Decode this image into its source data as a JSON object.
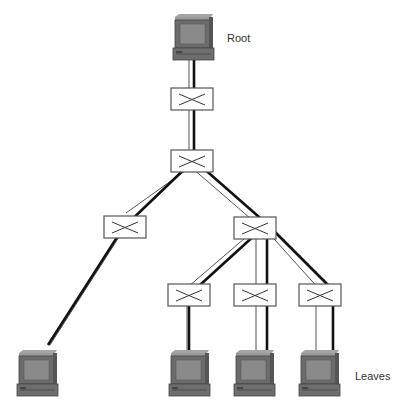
{
  "labels": {
    "root": "Root",
    "leaves": "Leaves"
  },
  "colors": {
    "computer_body": "#6b6b6b",
    "computer_screen": "#8a8a8a",
    "link_thick": "#111111",
    "link_thin": "#555555",
    "switch_border": "#555555"
  },
  "nodes": {
    "root_computer": {
      "type": "computer",
      "x": 173,
      "y": 14
    },
    "switch_1": {
      "type": "switch",
      "x": 171,
      "y": 88
    },
    "switch_2": {
      "type": "switch",
      "x": 171,
      "y": 150
    },
    "switch_left": {
      "type": "switch",
      "x": 104,
      "y": 216
    },
    "switch_right": {
      "type": "switch",
      "x": 234,
      "y": 217
    },
    "switch_bottom_1": {
      "type": "switch",
      "x": 168,
      "y": 284
    },
    "switch_bottom_2": {
      "type": "switch",
      "x": 234,
      "y": 284
    },
    "switch_bottom_3": {
      "type": "switch",
      "x": 299,
      "y": 284
    },
    "leaf_1": {
      "type": "computer",
      "x": 17,
      "y": 350
    },
    "leaf_2": {
      "type": "computer",
      "x": 169,
      "y": 350
    },
    "leaf_3": {
      "type": "computer",
      "x": 234,
      "y": 350
    },
    "leaf_4": {
      "type": "computer",
      "x": 299,
      "y": 350
    }
  }
}
